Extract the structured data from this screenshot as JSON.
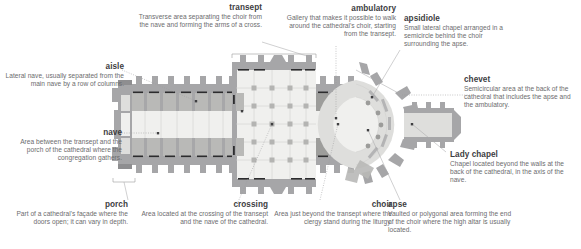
{
  "diagram": {
    "type": "annotated-architectural-plan",
    "palette": {
      "text_term": "#3d3d3f",
      "text_desc": "#6c6c6e",
      "leader": "#a9a9ab",
      "wall": "#a6a6a8",
      "bay_light": "#f0f0ee",
      "bay_mid": "#dededc",
      "bay_dark": "#b9b9b7",
      "accent_bar": "#2c2c2e",
      "background": "#ffffff"
    }
  },
  "annotations": [
    {
      "id": "transept",
      "term": "transept",
      "desc": "Transverse area separating the choir from the nave and forming the arms of a cross.",
      "align": "right"
    },
    {
      "id": "ambulatory",
      "term": "ambulatory",
      "desc": "Gallery that makes it possible to walk around the cathedral's choir, starting from the transept.",
      "align": "right"
    },
    {
      "id": "apsidiole",
      "term": "apsidiole",
      "desc": "Small lateral chapel arranged in a semicircle behind the choir surrounding the apse.",
      "align": "left"
    },
    {
      "id": "aisle",
      "term": "aisle",
      "desc": "Lateral nave, usually separated from the main nave by a row of columns.",
      "align": "right"
    },
    {
      "id": "chevet",
      "term": "chevet",
      "desc": "Semicircular area at the back of the cathedral that includes the apse and the ambulatory.",
      "align": "left"
    },
    {
      "id": "nave",
      "term": "nave",
      "desc": "Area between the transept and the porch of the cathedral where the congregation gathers.",
      "align": "right"
    },
    {
      "id": "lady-chapel",
      "term": "Lady chapel",
      "desc": "Chapel located beyond the walls at the back of the cathedral, in the axis of the nave.",
      "align": "left"
    },
    {
      "id": "porch",
      "term": "porch",
      "desc": "Part of a cathedral's façade where the doors open; it can vary in depth.",
      "align": "right"
    },
    {
      "id": "crossing",
      "term": "crossing",
      "desc": "Area located at the crossing of the transept and the nave of the cathedral.",
      "align": "right"
    },
    {
      "id": "choir",
      "term": "choir",
      "desc": "Area just beyond the transept where the clergy stand during the liturgy.",
      "align": "right"
    },
    {
      "id": "apse",
      "term": "apse",
      "desc": "Vaulted or polygonal area forming the end of the choir where the high altar is usually located.",
      "align": "left"
    }
  ]
}
